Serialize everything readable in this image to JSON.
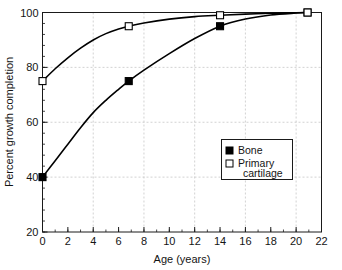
{
  "chart_data": {
    "type": "line",
    "title": "",
    "xlabel": "Age (years)",
    "ylabel": "Percent growth completion",
    "xlim": [
      0,
      22
    ],
    "ylim": [
      20,
      100
    ],
    "xticks": [
      0,
      2,
      4,
      6,
      8,
      10,
      12,
      14,
      16,
      18,
      20,
      22
    ],
    "xtick_labels": [
      "0",
      "2",
      "4",
      "6",
      "8",
      "10",
      "12",
      "14",
      "16",
      "18",
      "20",
      "22"
    ],
    "yticks": [
      20,
      40,
      60,
      80,
      100
    ],
    "ytick_labels": [
      "20",
      "40",
      "60",
      "80",
      "100"
    ],
    "x_minor_step": 1,
    "y_minor_step": 4,
    "grid": true,
    "grid_style": "dashed",
    "grid_x_values": [
      4,
      8,
      12,
      16,
      20
    ],
    "grid_y_values": [
      40,
      60,
      80,
      100
    ],
    "legend_position": "center-right",
    "series": [
      {
        "name": "Bone",
        "marker": "filled-square",
        "color": "#000000",
        "points": [
          {
            "x": 0,
            "y": 40
          },
          {
            "x": 6.8,
            "y": 75
          },
          {
            "x": 14,
            "y": 95
          },
          {
            "x": 20.9,
            "y": 100
          }
        ],
        "curve": [
          {
            "x": 0,
            "y": 40
          },
          {
            "x": 1,
            "y": 46
          },
          {
            "x": 2,
            "y": 52
          },
          {
            "x": 3,
            "y": 58
          },
          {
            "x": 4,
            "y": 63.5
          },
          {
            "x": 5,
            "y": 68
          },
          {
            "x": 6,
            "y": 72
          },
          {
            "x": 6.8,
            "y": 75
          },
          {
            "x": 8,
            "y": 79
          },
          {
            "x": 10,
            "y": 85
          },
          {
            "x": 12,
            "y": 90.5
          },
          {
            "x": 14,
            "y": 95
          },
          {
            "x": 16,
            "y": 97.6
          },
          {
            "x": 18,
            "y": 99.1
          },
          {
            "x": 20,
            "y": 99.8
          },
          {
            "x": 20.9,
            "y": 100
          }
        ]
      },
      {
        "name": "Primary cartilage",
        "marker": "open-square",
        "color": "#000000",
        "points": [
          {
            "x": 0,
            "y": 75
          },
          {
            "x": 6.8,
            "y": 95
          },
          {
            "x": 14,
            "y": 99
          },
          {
            "x": 20.9,
            "y": 100
          }
        ],
        "curve": [
          {
            "x": 0,
            "y": 75
          },
          {
            "x": 1,
            "y": 79.5
          },
          {
            "x": 2,
            "y": 83.5
          },
          {
            "x": 3,
            "y": 87
          },
          {
            "x": 4,
            "y": 90
          },
          {
            "x": 5,
            "y": 92.3
          },
          {
            "x": 6,
            "y": 94
          },
          {
            "x": 6.8,
            "y": 95
          },
          {
            "x": 8,
            "y": 96.2
          },
          {
            "x": 10,
            "y": 97.6
          },
          {
            "x": 12,
            "y": 98.5
          },
          {
            "x": 14,
            "y": 99
          },
          {
            "x": 16,
            "y": 99.4
          },
          {
            "x": 18,
            "y": 99.7
          },
          {
            "x": 20,
            "y": 99.9
          },
          {
            "x": 20.9,
            "y": 100
          }
        ]
      }
    ],
    "legend": [
      {
        "label": "Bone",
        "marker": "filled-square"
      },
      {
        "label": "Primary",
        "label2": "cartilage",
        "marker": "open-square"
      }
    ]
  },
  "colors": {
    "background": "#ffffff",
    "axis": "#1a1a1a",
    "grid": "#c8c8c8",
    "series": "#000000",
    "text": "#141414"
  }
}
